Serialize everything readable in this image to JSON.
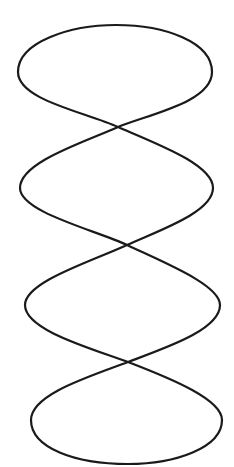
{
  "diagram": {
    "type": "line-drawing",
    "loop_count": 4,
    "crossing_count": 3,
    "stroke_color": "#1a1a1a",
    "background_color": "#ffffff",
    "strand_a": "M118,127 C85,112 18,100 18,72 C18,42 70,25 116,25 C165,25 212,42 212,72 C212,102 150,114 118,127 C160,145 213,165 213,188 C213,212 160,230 127,245 C165,263 220,285 220,305 C220,330 165,348 128,362 C175,380 222,400 222,420 C222,448 175,464 128,464 C75,464 31,448 31,420 C31,395 85,378 128,362 C90,348 25,330 25,305 C25,282 90,262 127,245 C95,230 20,212 20,188 C20,162 85,142 118,127 Z",
    "crossings": [
      {
        "x": 118,
        "y": 127
      },
      {
        "x": 127,
        "y": 245
      },
      {
        "x": 128,
        "y": 362
      }
    ]
  }
}
